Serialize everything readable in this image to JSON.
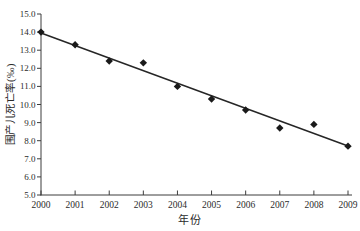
{
  "chart_data": {
    "type": "scatter",
    "title": "",
    "xlabel": "年份",
    "ylabel": "围产儿死亡率(‰)",
    "x": [
      2000,
      2001,
      2002,
      2003,
      2004,
      2005,
      2006,
      2007,
      2008,
      2009
    ],
    "xtick_labels": [
      "2000",
      "2001",
      "2002",
      "2003",
      "2004",
      "2005",
      "2006",
      "2007",
      "2008",
      "2009"
    ],
    "series": [
      {
        "values": [
          14.0,
          13.3,
          12.4,
          12.3,
          11.0,
          10.3,
          9.7,
          8.7,
          8.9,
          7.7
        ]
      }
    ],
    "ylim": [
      5.0,
      15.0
    ],
    "ytick_step": 1.0,
    "ytick_labels": [
      "15.0",
      "14.0",
      "13.0",
      "12.0",
      "11.0",
      "10.0",
      "9.0",
      "8.0",
      "7.0",
      "6.0",
      "5.0"
    ],
    "trendline": {
      "start": [
        2000,
        13.95
      ],
      "end": [
        2009,
        7.71
      ]
    },
    "marker": "diamond",
    "grid": false,
    "legend": "none",
    "colors": {
      "background": "#ffffff",
      "marker": "#1a1a1a",
      "trend_line": "#262626",
      "axis": "#3d3d3d",
      "text": "#2b2b2b"
    }
  }
}
